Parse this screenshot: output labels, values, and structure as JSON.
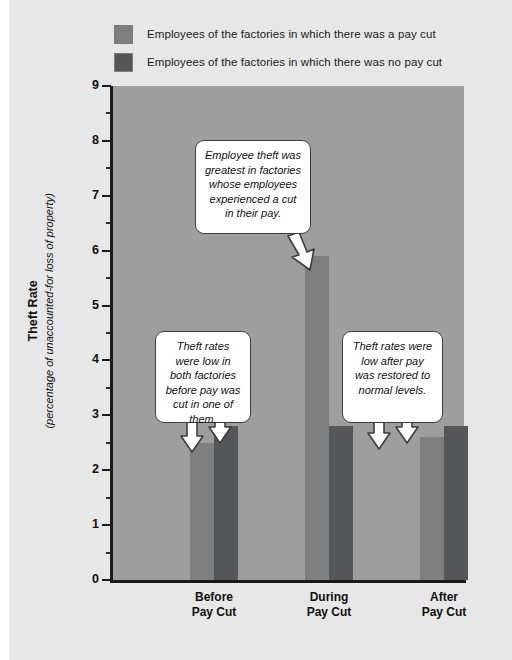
{
  "legend": {
    "items": [
      {
        "label": "Employees of the factories in which there was a pay cut",
        "color": "#7f7f7f",
        "swatch_name": "legend-swatch-pay-cut"
      },
      {
        "label": "Employees of the factories in which there was no pay cut",
        "color": "#555658",
        "swatch_name": "legend-swatch-no-pay-cut"
      }
    ]
  },
  "axis": {
    "y_title_main": "Theft Rate",
    "y_title_sub": "(percentage of unaccounted-for loss of property)",
    "y_ticks": [
      "9",
      "8",
      "7",
      "6",
      "5",
      "4",
      "3",
      "2",
      "1",
      "0"
    ]
  },
  "callouts": [
    {
      "id": "callout-during",
      "text": "Employee theft was greatest in factories whose employees experienced a cut in their pay."
    },
    {
      "id": "callout-before",
      "text": "Theft rates were low in both factories before pay was cut in one of them."
    },
    {
      "id": "callout-after",
      "text": "Theft rates were low after pay was restored to normal levels."
    }
  ],
  "categories": [
    {
      "line1": "Before",
      "line2": "Pay Cut"
    },
    {
      "line1": "During",
      "line2": "Pay Cut"
    },
    {
      "line1": "After",
      "line2": "Pay Cut"
    }
  ],
  "chart_data": {
    "type": "bar",
    "title": "",
    "xlabel": "",
    "ylabel": "Theft Rate (percentage of unaccounted-for loss of property)",
    "categories": [
      "Before Pay Cut",
      "During Pay Cut",
      "After Pay Cut"
    ],
    "series": [
      {
        "name": "Employees of the factories in which there was a pay cut",
        "color": "#7f7f7f",
        "values": [
          2.5,
          5.9,
          2.6
        ]
      },
      {
        "name": "Employees of the factories in which there was no pay cut",
        "color": "#555658",
        "values": [
          2.8,
          2.8,
          2.8
        ]
      }
    ],
    "ylim": [
      0,
      9
    ],
    "ytick_step": 1,
    "yminor_step": 0.5,
    "grid": false,
    "legend_position": "top",
    "plot_background": "#9e9e9e",
    "page_background": "#e6e7e6",
    "annotations": [
      {
        "text": "Employee theft was greatest in factories whose employees experienced a cut in their pay.",
        "points_to": {
          "category": "During Pay Cut",
          "series": "Employees of the factories in which there was a pay cut",
          "value": 5.9
        }
      },
      {
        "text": "Theft rates were low in both factories before pay was cut in one of them.",
        "points_to": {
          "category": "Before Pay Cut",
          "series": "both",
          "value": 2.5
        }
      },
      {
        "text": "Theft rates were low after pay was restored to normal levels.",
        "points_to": {
          "category": "After Pay Cut",
          "series": "both",
          "value": 2.6
        }
      }
    ]
  }
}
